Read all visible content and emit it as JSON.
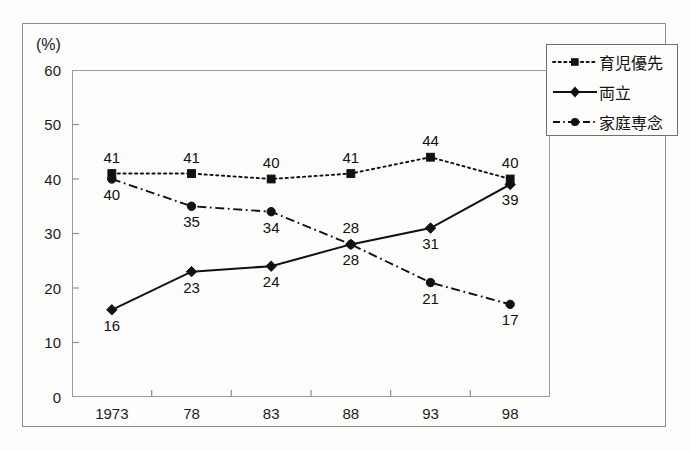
{
  "axis": {
    "unit_label": "(%)",
    "y_ticks": [
      "0",
      "10",
      "20",
      "30",
      "40",
      "50",
      "60"
    ],
    "x_ticks": [
      "1973",
      "78",
      "83",
      "88",
      "93",
      "98"
    ]
  },
  "legend": {
    "items": [
      {
        "label": "育児優先",
        "style": "dotted",
        "marker": "square"
      },
      {
        "label": "両立",
        "style": "solid",
        "marker": "diamond"
      },
      {
        "label": "家庭専念",
        "style": "dashdot",
        "marker": "circle"
      }
    ]
  },
  "colors": {
    "ink": "#111111",
    "frame": "#8d8d8d",
    "plot_border": "#9a9a9a",
    "background": "#fdfdfc"
  },
  "chart_data": {
    "type": "line",
    "title": "",
    "subtitle": "",
    "xlabel": "",
    "ylabel": "(%)",
    "categories": [
      "1973",
      "78",
      "83",
      "88",
      "93",
      "98"
    ],
    "ylim": [
      0,
      60
    ],
    "ytick_step": 10,
    "grid": false,
    "legend_position": "top-right",
    "data_labels": true,
    "series": [
      {
        "name": "育児優先",
        "marker": "square",
        "linestyle": "dotted",
        "values": [
          41,
          41,
          40,
          41,
          44,
          40
        ],
        "label_positions": [
          "above",
          "above",
          "above",
          "above",
          "above",
          "above"
        ]
      },
      {
        "name": "両立",
        "marker": "diamond",
        "linestyle": "solid",
        "values": [
          16,
          23,
          24,
          28,
          31,
          39
        ],
        "label_positions": [
          "below",
          "below",
          "below",
          "above",
          "below",
          "below"
        ]
      },
      {
        "name": "家庭専念",
        "marker": "circle",
        "linestyle": "dashdot",
        "values": [
          40,
          35,
          34,
          28,
          21,
          17
        ],
        "label_positions": [
          "below",
          "below",
          "below",
          "below",
          "below",
          "below"
        ]
      }
    ]
  }
}
